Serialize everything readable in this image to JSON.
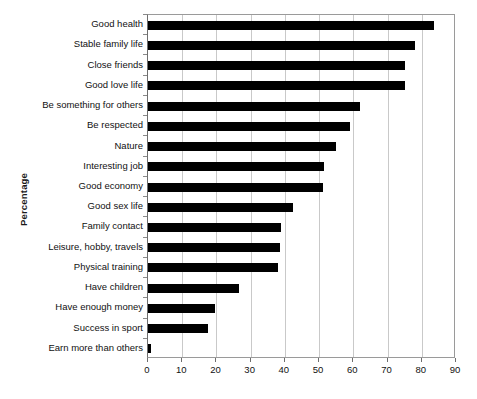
{
  "chart_data": {
    "type": "bar",
    "orientation": "horizontal",
    "title": "",
    "xlabel": "",
    "ylabel": "Percentage",
    "xlim": [
      0,
      90
    ],
    "xticks": [
      0,
      10,
      20,
      30,
      40,
      50,
      60,
      70,
      80,
      90
    ],
    "grid": "vertical",
    "legend": "none",
    "bar_color": "#000000",
    "categories": [
      "Good health",
      "Stable family life",
      "Close friends",
      "Good love life",
      "Be something for others",
      "Be respected",
      "Nature",
      "Interesting job",
      "Good economy",
      "Good sex life",
      "Family contact",
      "Leisure, hobby, travels",
      "Physical training",
      "Have children",
      "Have enough money",
      "Success in sport",
      "Earn more than others"
    ],
    "values": [
      83.5,
      78,
      75,
      75,
      62,
      59,
      55,
      51.5,
      51,
      42.5,
      39,
      38.5,
      38,
      26.5,
      19.5,
      17.5,
      1
    ]
  }
}
